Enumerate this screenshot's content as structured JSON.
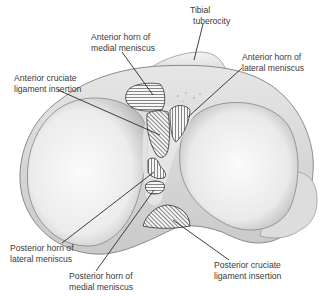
{
  "diagram": {
    "colors": {
      "background": "#ffffff",
      "bone_light": "#f2f2f2",
      "bone_mid": "#dcdcdc",
      "bone_shadow": "#a9a9a9",
      "outline": "#7a7a7a",
      "hatch": "#555555",
      "leader": "#2a2a2a",
      "label_text": "#3a3a3a"
    },
    "labels": [
      {
        "id": "tibial-tuberosity",
        "lines": [
          "Tibial",
          "tuberocity"
        ]
      },
      {
        "id": "anterior-horn-medial",
        "lines": [
          "Anterior horn of",
          "medial meniscus"
        ]
      },
      {
        "id": "anterior-horn-lateral",
        "lines": [
          "Anterior horn of",
          "lateral meniscus"
        ]
      },
      {
        "id": "acl-insertion",
        "lines": [
          "Anterior cruciate",
          "ligament insertion"
        ]
      },
      {
        "id": "posterior-horn-lateral",
        "lines": [
          "Posterior horn of",
          "lateral meniscus"
        ]
      },
      {
        "id": "posterior-horn-medial",
        "lines": [
          "Posterior horn of",
          "medial meniscus"
        ]
      },
      {
        "id": "pcl-insertion",
        "lines": [
          "Posterior cruciate",
          "ligament insertion"
        ]
      }
    ]
  }
}
